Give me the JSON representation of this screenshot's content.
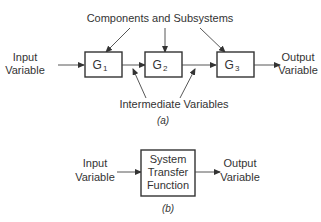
{
  "diagram_a": {
    "caption": "(a)",
    "annotation_top": "Components and Subsystems",
    "annotation_bottom": "Intermediate Variables",
    "input_label": [
      "Input",
      "Variable"
    ],
    "output_label": [
      "Output",
      "Variable"
    ],
    "blocks": [
      {
        "name": "G",
        "sub": "1"
      },
      {
        "name": "G",
        "sub": "2"
      },
      {
        "name": "G",
        "sub": "3"
      }
    ]
  },
  "diagram_b": {
    "caption": "(b)",
    "input_label": [
      "Input",
      "Variable"
    ],
    "output_label": [
      "Output",
      "Variable"
    ],
    "block_label": [
      "System",
      "Transfer",
      "Function"
    ]
  },
  "colors": {
    "stroke": "#333333",
    "background": "#ffffff"
  }
}
